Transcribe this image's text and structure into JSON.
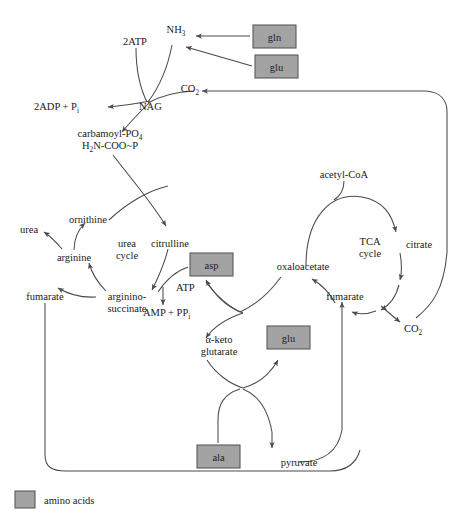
{
  "figure": {
    "type": "metabolic-pathway-diagram",
    "background": "#ffffff",
    "amino_acid_box_color": "#a3a3a3",
    "line_color": "#4a4a4a"
  },
  "legend": {
    "swatch_color": "#a3a3a3",
    "label": "amino acids"
  },
  "amino_acid_boxes": [
    {
      "id": "gln",
      "label": "gln",
      "x": 253,
      "y": 25,
      "w": 43,
      "h": 23
    },
    {
      "id": "glu1",
      "label": "glu",
      "x": 255,
      "y": 55,
      "w": 43,
      "h": 23
    },
    {
      "id": "asp",
      "label": "asp",
      "x": 190,
      "y": 253,
      "w": 43,
      "h": 23
    },
    {
      "id": "glu2",
      "label": "glu",
      "x": 267,
      "y": 326,
      "w": 43,
      "h": 23
    },
    {
      "id": "ala",
      "label": "ala",
      "x": 197,
      "y": 445,
      "w": 43,
      "h": 23
    }
  ],
  "labels": {
    "two_atp": "2ATP",
    "nh3": "NH",
    "nh3_sub": "3",
    "co2_top": "CO",
    "co2_top_sub": "2",
    "two_adp": "2ADP + P",
    "two_adp_sub": "i",
    "nag": "NAG",
    "carbamoyl_line1": "carbamoyl-PO",
    "carbamoyl_line1_sub": "4",
    "carbamoyl_line2_a": "H",
    "carbamoyl_line2_sub": "2",
    "carbamoyl_line2_b": "N-COO~P",
    "ornithine": "ornithine",
    "urea": "urea",
    "arginine": "arginine",
    "urea_cycle_line1": "urea",
    "urea_cycle_line2": "cycle",
    "citrulline": "citrulline",
    "atp": "ATP",
    "amp": "AMP + PP",
    "amp_sub": "i",
    "fumarate_left": "fumarate",
    "argininosuccinate_line1": "arginino-",
    "argininosuccinate_line2": "succinate",
    "acetyl_coa": "acetyl-CoA",
    "tca_cycle_line1": "TCA",
    "tca_cycle_line2": "cycle",
    "citrate": "citrate",
    "oxaloacetate": "oxaloacetate",
    "fumarate_right": "fumarate",
    "co2_bottom": "CO",
    "co2_bottom_sub": "2",
    "alpha_keto_line1": "α-keto",
    "alpha_keto_line2": "glutarate",
    "pyruvate": "pyruvate"
  },
  "pathway_edges": [
    {
      "from": "gln",
      "to": "nh3"
    },
    {
      "from": "glu1",
      "to": "nh3"
    },
    {
      "from": "nh3",
      "to": "nag"
    },
    {
      "from": "two_atp",
      "to": "nag"
    },
    {
      "from": "co2_top",
      "to": "nag"
    },
    {
      "from": "nag",
      "to": "two_adp"
    },
    {
      "from": "nag",
      "to": "carbamoyl_phosphate"
    },
    {
      "from": "carbamoyl_phosphate",
      "to": "citrulline"
    },
    {
      "from": "citrulline",
      "to": "argininosuccinate"
    },
    {
      "from": "asp",
      "to": "argininosuccinate"
    },
    {
      "from": "atp",
      "to": "amp"
    },
    {
      "from": "argininosuccinate",
      "to": "arginine"
    },
    {
      "from": "argininosuccinate",
      "to": "fumarate_left"
    },
    {
      "from": "arginine",
      "to": "ornithine"
    },
    {
      "from": "arginine",
      "to": "urea"
    },
    {
      "from": "ornithine",
      "to": "citrulline"
    },
    {
      "from": "acetyl_coa",
      "to": "citrate"
    },
    {
      "from": "citrate",
      "to": "co2_bottom"
    },
    {
      "from": "co2_bottom",
      "to": "co2_top"
    },
    {
      "from": "co2_bottom",
      "to": "fumarate_right"
    },
    {
      "from": "fumarate_right",
      "to": "oxaloacetate"
    },
    {
      "from": "oxaloacetate",
      "to": "acetyl_coa_cycle"
    },
    {
      "from": "oxaloacetate",
      "to": "asp"
    },
    {
      "from": "alpha_ketoglutarate",
      "to": "glu2"
    },
    {
      "from": "glu2",
      "to": "alpha_ketoglutarate"
    },
    {
      "from": "ala",
      "to": "glu2"
    },
    {
      "from": "alpha_ketoglutarate",
      "to": "pyruvate"
    },
    {
      "from": "pyruvate",
      "to": "fumarate_right"
    },
    {
      "from": "fumarate_left",
      "to": "pyruvate_loop"
    }
  ]
}
